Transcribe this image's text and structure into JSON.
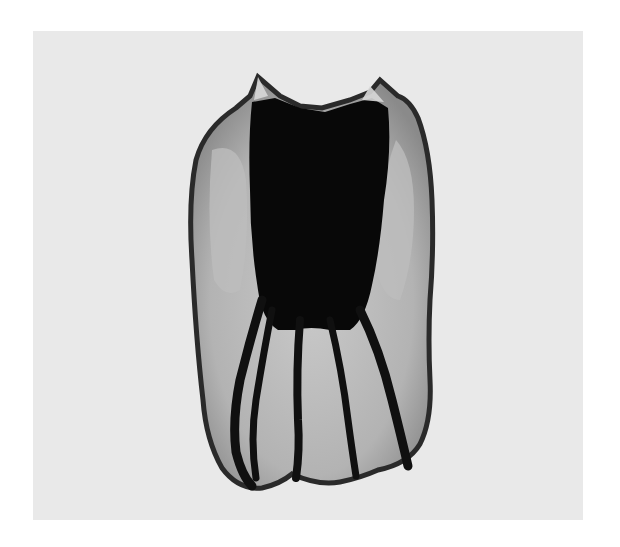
{
  "image": {
    "subject": "radiograph of an extracted tooth with dark-filled canals",
    "alt": "Grayscale image of a multi-rooted tooth crown-up with dense dark filled pulp chamber and canals on a light gray background",
    "colors": {
      "page_background": "#ffffff",
      "panel_background": "#e9e9e9",
      "tooth_enamel": "#b8b8b8",
      "tooth_outline": "#2a2a2a",
      "filling_dark": "#080808"
    }
  }
}
